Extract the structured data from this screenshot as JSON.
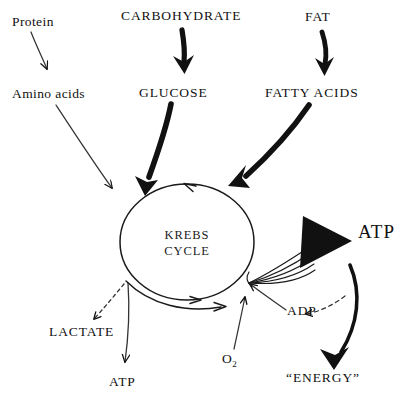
{
  "diagram": {
    "background": "#ffffff",
    "ink": "#111111",
    "nodes": {
      "protein": "Protein",
      "amino_acids": "Amino acids",
      "carbohydrate": "CARBOHYDRATE",
      "glucose": "GLUCOSE",
      "fat": "FAT",
      "fatty_acids": "FATTY ACIDS",
      "krebs_line1": "KREBS",
      "krebs_line2": "CYCLE",
      "lactate": "LACTATE",
      "atp_bottom": "ATP",
      "atp_right": "ATP",
      "adp": "ADP",
      "oxygen_main": "O",
      "oxygen_sub": "2",
      "energy": "“ENERGY”"
    },
    "edges": [
      {
        "name": "protein-to-amino-acids",
        "style": "thin-solid"
      },
      {
        "name": "amino-acids-to-krebs",
        "style": "thin-solid"
      },
      {
        "name": "carbohydrate-to-glucose",
        "style": "thick-solid"
      },
      {
        "name": "glucose-to-krebs",
        "style": "thick-tapered"
      },
      {
        "name": "fat-to-fatty-acids",
        "style": "thick-solid"
      },
      {
        "name": "fatty-acids-to-krebs",
        "style": "thick-tapered"
      },
      {
        "name": "krebs-to-lactate",
        "style": "dashed"
      },
      {
        "name": "krebs-to-atp-bottom",
        "style": "thin-solid"
      },
      {
        "name": "krebs-to-atp-right",
        "style": "multi-line-bundle"
      },
      {
        "name": "atp-right-to-energy",
        "style": "thick-curved"
      },
      {
        "name": "energy-to-adp",
        "style": "dashed"
      },
      {
        "name": "adp-to-krebs",
        "style": "thin-solid"
      },
      {
        "name": "oxygen-to-krebs",
        "style": "thin-solid"
      },
      {
        "name": "krebs-cycle-ring",
        "style": "ring-with-arrowheads"
      }
    ]
  }
}
